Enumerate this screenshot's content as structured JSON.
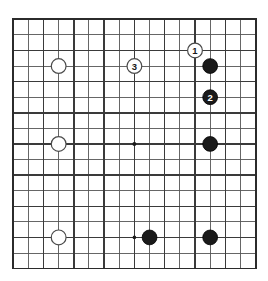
{
  "diagram": {
    "type": "go-board-diagram",
    "board": {
      "lines_x": 17,
      "lines_y": 17,
      "origin_x": 13.2,
      "origin_y": 19.3,
      "spacing_x": 15.15,
      "spacing_y": 15.58,
      "line_color": "#3a3a3a",
      "minor_line_color": "#555555",
      "border_color": "#2b2b2b",
      "background_color": "#ffffff",
      "line_width_major": 1.5,
      "line_width_minor": 0.9,
      "border_width": 1.8
    },
    "star_points": [
      {
        "col": 8,
        "row": 8,
        "radius": 2.0
      },
      {
        "col": 8,
        "row": 14,
        "radius": 1.8
      }
    ],
    "stone_radius": 7.4,
    "stones": [
      {
        "id": "w-a",
        "color": "white",
        "col": 3,
        "row": 3,
        "label": ""
      },
      {
        "id": "w-b",
        "color": "white",
        "col": 3,
        "row": 8,
        "label": ""
      },
      {
        "id": "w-c",
        "color": "white",
        "col": 3,
        "row": 14,
        "label": ""
      },
      {
        "id": "b-a",
        "color": "black",
        "col": 13,
        "row": 3,
        "label": ""
      },
      {
        "id": "b-b",
        "color": "black",
        "col": 13,
        "row": 8,
        "label": ""
      },
      {
        "id": "b-c",
        "color": "black",
        "col": 13,
        "row": 14,
        "label": ""
      },
      {
        "id": "b-d",
        "color": "black",
        "col": 9,
        "row": 14,
        "label": ""
      },
      {
        "id": "move-1",
        "color": "white",
        "col": 12,
        "row": 2,
        "label": "1"
      },
      {
        "id": "move-2",
        "color": "black",
        "col": 13,
        "row": 5,
        "label": "2"
      },
      {
        "id": "move-3",
        "color": "white",
        "col": 8,
        "row": 3,
        "label": "3"
      }
    ],
    "colors": {
      "black_stone_fill": "#1a1a1a",
      "black_stone_stroke": "#000000",
      "white_stone_fill": "#ffffff",
      "white_stone_stroke": "#4a4a4a",
      "black_label_text": "#ffffff",
      "white_label_text": "#1a1a1a"
    },
    "label_font_size": 9.5
  }
}
